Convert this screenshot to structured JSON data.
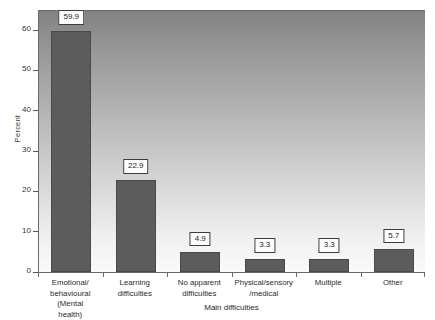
{
  "chart_data": {
    "type": "bar",
    "title": "",
    "xlabel": "Main difficulties",
    "ylabel": "Percent",
    "categories": [
      "Emotional/ behavioural (Mental health)",
      "Learning difficulties",
      "No apparent difficulties",
      "Physical/sensory /medical",
      "Multiple",
      "Other"
    ],
    "category_lines": [
      [
        "Emotional/",
        "behavioural",
        "(Mental",
        "health)"
      ],
      [
        "Learning",
        "difficulties"
      ],
      [
        "No apparent",
        "difficulties"
      ],
      [
        "Physical/sensory",
        "/medical"
      ],
      [
        "Multiple"
      ],
      [
        "Other"
      ]
    ],
    "values": [
      59.9,
      22.9,
      4.9,
      3.3,
      3.3,
      5.7
    ],
    "value_labels": [
      "59.9",
      "22.9",
      "4.9",
      "3.3",
      "3.3",
      "5.7"
    ],
    "ylim": [
      0,
      65
    ],
    "yticks": [
      0,
      10,
      20,
      30,
      40,
      50,
      60
    ],
    "ytick_labels": [
      "0",
      "10",
      "20",
      "30",
      "40",
      "50",
      "60"
    ],
    "grid": false,
    "legend": false,
    "bar_color": "#5c5c5c",
    "bar_border_color": "#4a4a4a",
    "label_box_bg": "#fdfdfd",
    "label_box_border": "#3d3d3d",
    "axis_color": "#6a6a6a",
    "plot_bg_top": "#828282",
    "plot_bg_bottom": "#fafafa"
  }
}
